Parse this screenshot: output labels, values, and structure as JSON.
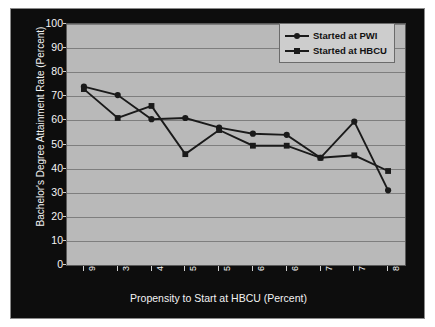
{
  "chart_data": {
    "type": "line",
    "title": "",
    "xlabel": "Propensity to Start at HBCU (Percent)",
    "ylabel": "Bachelor's Degree Attainment Rate (Percent)",
    "categories": [
      "9-38",
      "38-46",
      "46-53",
      "53-59",
      "59-64",
      "64-69",
      "69-74",
      "74-79",
      "79-84",
      "84-94"
    ],
    "ylim": [
      0,
      100
    ],
    "yticks": [
      0,
      10,
      20,
      30,
      40,
      50,
      60,
      70,
      80,
      90,
      100
    ],
    "grid": true,
    "legend_position": "top-right",
    "series": [
      {
        "name": "Started at PWI",
        "marker": "circle",
        "color": "#1a1a1a",
        "values": [
          74,
          70.5,
          60.5,
          61,
          57,
          54.5,
          54,
          44.5,
          59.5,
          31
        ]
      },
      {
        "name": "Started at HBCU",
        "marker": "square",
        "color": "#1a1a1a",
        "values": [
          73,
          61,
          66,
          46,
          56,
          49.5,
          49.5,
          44.5,
          45.5,
          39
        ]
      }
    ]
  },
  "legend": {
    "items": [
      {
        "label": "Started at PWI"
      },
      {
        "label": "Started at HBCU"
      }
    ]
  },
  "colors": {
    "plot_background": "#b9b9b9",
    "frame_background": "#0d0d0d",
    "gridline": "#7e7e7e",
    "series": "#1a1a1a",
    "tick_text": "#f5f5f5"
  }
}
